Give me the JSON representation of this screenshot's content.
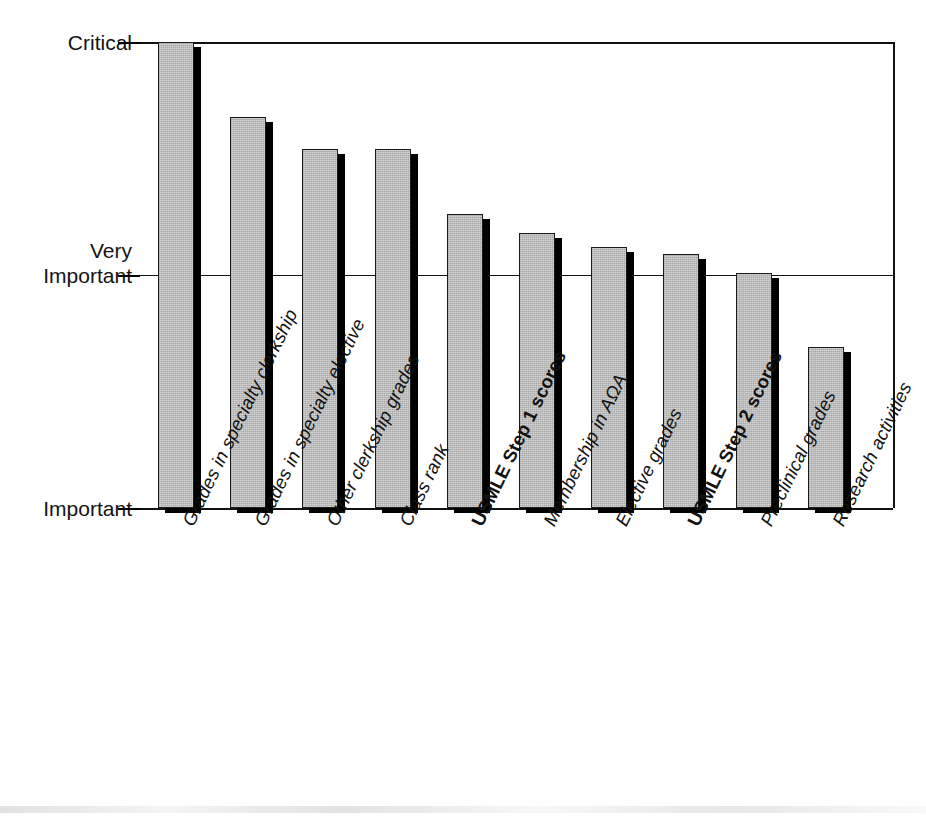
{
  "chart_data": {
    "type": "bar",
    "title": "",
    "subtitle": "",
    "xlabel": "",
    "ylabel": "",
    "categories": [
      "Grades in specialty clerkship",
      "Grades in specialty elective",
      "Other clerkship grades",
      "Class rank",
      "USMLE Step 1 scores",
      "Membership in AΩA",
      "Elective grades",
      "USMLE Step 2 scores",
      "Preclinical grades",
      "Research activities"
    ],
    "values": [
      3.0,
      2.68,
      2.54,
      2.54,
      2.26,
      2.18,
      2.12,
      2.09,
      2.01,
      1.69
    ],
    "emphasis": [
      false,
      false,
      false,
      false,
      true,
      false,
      false,
      true,
      false,
      false
    ],
    "ylim": [
      1.0,
      3.0
    ],
    "ytick_values": [
      3.0,
      2.0,
      1.0
    ],
    "ytick_labels": [
      "Critical",
      "Very\nImportant",
      "Important"
    ],
    "grid": true,
    "gridlines_at": [
      3.0,
      2.0,
      1.0
    ],
    "legend": null,
    "legend_position": "none",
    "bar_color": "#b5b5b5",
    "bar_edge_color": "#1a1a1a",
    "bar_shadow_color": "#000000",
    "axis_color": "#111111",
    "label_rotation_deg": -64
  },
  "yaxis": {
    "ticks": [
      {
        "id": "critical",
        "label": "Critical",
        "value": 3.0
      },
      {
        "id": "very",
        "label": "Very\nImportant",
        "value": 2.0
      },
      {
        "id": "important",
        "label": "Important",
        "value": 1.0
      }
    ]
  },
  "xaxis": {
    "labels": [
      {
        "text": "Grades in specialty clerkship",
        "bold": false
      },
      {
        "text": "Grades in specialty elective",
        "bold": false
      },
      {
        "text": "Other clerkship grades",
        "bold": false
      },
      {
        "text": "Class rank",
        "bold": false
      },
      {
        "text": "USMLE Step 1 scores",
        "bold": true
      },
      {
        "text": "Membership in AΩA",
        "bold": false
      },
      {
        "text": "Elective grades",
        "bold": false
      },
      {
        "text": "USMLE Step 2 scores",
        "bold": true
      },
      {
        "text": "Preclinical grades",
        "bold": false
      },
      {
        "text": "Research activities",
        "bold": false
      }
    ]
  }
}
